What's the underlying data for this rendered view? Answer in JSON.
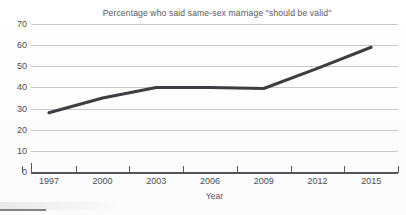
{
  "chart_data": {
    "type": "line",
    "title": "Percentage who said same-sex marriage \"should be valid\"",
    "xlabel": "Year",
    "ylabel": "",
    "x": [
      1997,
      2000,
      2003,
      2006,
      2009,
      2012,
      2015
    ],
    "categories": [
      "1997",
      "2000",
      "2003",
      "2006",
      "2009",
      "2012",
      "2015"
    ],
    "values": [
      28,
      35,
      40,
      40,
      39.5,
      49,
      59
    ],
    "series": [
      {
        "name": "Percentage who said same-sex marriage should be valid",
        "values": [
          28,
          35,
          40,
          40,
          39.5,
          49,
          59
        ]
      }
    ],
    "xlim": [
      1996,
      2016.5
    ],
    "ylim": [
      0,
      70
    ],
    "ytick_labels": [
      "70",
      "60",
      "50",
      "40",
      "30",
      "20",
      "10",
      "0"
    ],
    "ytick_values": [
      70,
      60,
      50,
      40,
      30,
      20,
      10,
      0
    ],
    "xtick_labels": [
      "1997",
      "2000",
      "2003",
      "2006",
      "2009",
      "2012",
      "2015"
    ],
    "grid": "horizontal",
    "legend": "none",
    "markers": "none",
    "line_color": "#3d3d42",
    "grid_color": "#c9c9cd",
    "axis_color": "#55555a",
    "text_color": "#4e4e52",
    "background_color": "#fdfdfd"
  },
  "axis": {
    "x_title": "Year"
  }
}
